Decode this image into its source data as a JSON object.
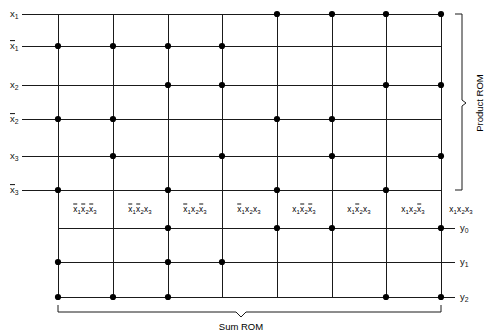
{
  "diagram": {
    "line_color": "#1a1a1a",
    "dot_color": "#000000",
    "geometry": {
      "grid_left": 58,
      "grid_right": 441,
      "grid_top": 14,
      "col_xs": [
        58,
        113,
        168,
        222,
        277,
        332,
        386,
        441
      ],
      "input_row_ys": [
        14,
        46,
        85,
        119,
        156,
        190
      ],
      "output_row_ys": [
        228,
        262,
        297
      ],
      "product_label_y": 209,
      "vline_top": 14,
      "vline_bottom": 297
    },
    "input_rows": [
      {
        "name": "x1",
        "label": "x",
        "subscript": "1",
        "overbar": false,
        "y": 14,
        "dots": [
          5,
          6,
          7,
          8
        ]
      },
      {
        "name": "x1bar",
        "label": "x",
        "subscript": "1",
        "overbar": true,
        "y": 46,
        "dots": [
          1,
          2,
          3,
          4
        ]
      },
      {
        "name": "x2",
        "label": "x",
        "subscript": "2",
        "overbar": false,
        "y": 85,
        "dots": [
          3,
          4,
          7,
          8
        ]
      },
      {
        "name": "x2bar",
        "label": "x",
        "subscript": "2",
        "overbar": true,
        "y": 119,
        "dots": [
          1,
          2,
          5,
          6
        ]
      },
      {
        "name": "x3",
        "label": "x",
        "subscript": "3",
        "overbar": false,
        "y": 156,
        "dots": [
          2,
          4,
          6,
          8
        ]
      },
      {
        "name": "x3bar",
        "label": "x",
        "subscript": "3",
        "overbar": true,
        "y": 190,
        "dots": [
          1,
          3,
          5,
          7
        ]
      }
    ],
    "output_rows": [
      {
        "name": "y0",
        "label": "y",
        "subscript": "0",
        "y": 228,
        "dots": [
          3,
          5,
          6,
          8
        ]
      },
      {
        "name": "y1",
        "label": "y",
        "subscript": "1",
        "y": 262,
        "dots": [
          1,
          3,
          4
        ]
      },
      {
        "name": "y2",
        "label": "y",
        "subscript": "2",
        "y": 297,
        "dots": [
          1,
          2,
          3,
          7,
          8
        ]
      }
    ],
    "product_terms": [
      {
        "index": 1,
        "x": 85,
        "parts": [
          {
            "v": "x",
            "s": "1",
            "bar": true
          },
          {
            "v": "x",
            "s": "2",
            "bar": true
          },
          {
            "v": "x",
            "s": "3",
            "bar": true
          }
        ]
      },
      {
        "index": 2,
        "x": 140,
        "parts": [
          {
            "v": "x",
            "s": "1",
            "bar": true
          },
          {
            "v": "x",
            "s": "2",
            "bar": true
          },
          {
            "v": "x",
            "s": "3",
            "bar": false
          }
        ]
      },
      {
        "index": 3,
        "x": 195,
        "parts": [
          {
            "v": "x",
            "s": "1",
            "bar": true
          },
          {
            "v": "x",
            "s": "2",
            "bar": false
          },
          {
            "v": "x",
            "s": "3",
            "bar": true
          }
        ]
      },
      {
        "index": 4,
        "x": 249,
        "parts": [
          {
            "v": "x",
            "s": "1",
            "bar": true
          },
          {
            "v": "x",
            "s": "2",
            "bar": false
          },
          {
            "v": "x",
            "s": "3",
            "bar": false
          }
        ]
      },
      {
        "index": 5,
        "x": 304,
        "parts": [
          {
            "v": "x",
            "s": "1",
            "bar": false
          },
          {
            "v": "x",
            "s": "2",
            "bar": true
          },
          {
            "v": "x",
            "s": "3",
            "bar": true
          }
        ]
      },
      {
        "index": 6,
        "x": 359,
        "parts": [
          {
            "v": "x",
            "s": "1",
            "bar": false
          },
          {
            "v": "x",
            "s": "2",
            "bar": true
          },
          {
            "v": "x",
            "s": "3",
            "bar": false
          }
        ]
      },
      {
        "index": 7,
        "x": 413,
        "parts": [
          {
            "v": "x",
            "s": "1",
            "bar": false
          },
          {
            "v": "x",
            "s": "2",
            "bar": false
          },
          {
            "v": "x",
            "s": "3",
            "bar": true
          }
        ]
      },
      {
        "index": 8,
        "x": 461,
        "parts": [
          {
            "v": "x",
            "s": "1",
            "bar": false
          },
          {
            "v": "x",
            "s": "2",
            "bar": false
          },
          {
            "v": "x",
            "s": "3",
            "bar": false
          }
        ]
      }
    ],
    "annotations": {
      "product_rom": "Product ROM",
      "sum_rom": "Sum ROM"
    }
  }
}
